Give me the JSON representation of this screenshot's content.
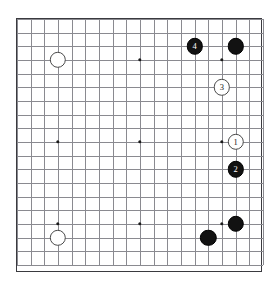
{
  "diagram": {
    "kind": "go-board-diagram",
    "board_size": 19,
    "geometry": {
      "origin_x": 16,
      "origin_y": 18,
      "spacing": 13.667,
      "lines": 19,
      "stone_radius": 7.2,
      "border_color": "#3a3a3f",
      "grid_color": "#8a8a90",
      "background": "#ffffff"
    },
    "star_points": [
      {
        "col": 3,
        "row": 3
      },
      {
        "col": 9,
        "row": 3
      },
      {
        "col": 15,
        "row": 3
      },
      {
        "col": 3,
        "row": 9
      },
      {
        "col": 9,
        "row": 9
      },
      {
        "col": 15,
        "row": 9
      },
      {
        "col": 3,
        "row": 15
      },
      {
        "col": 9,
        "row": 15
      },
      {
        "col": 15,
        "row": 15
      }
    ],
    "stones": [
      {
        "id": "stone-white-upper-left",
        "color": "white",
        "label": "",
        "col": 3,
        "row": 3
      },
      {
        "id": "stone-white-lower-left",
        "color": "white",
        "label": "",
        "col": 3,
        "row": 16
      },
      {
        "id": "stone-black-move-4",
        "color": "black",
        "label": "4",
        "col": 13,
        "row": 2
      },
      {
        "id": "stone-black-corner-top",
        "color": "black",
        "label": "",
        "col": 16,
        "row": 2
      },
      {
        "id": "stone-white-move-3",
        "color": "white",
        "label": "3",
        "col": 15,
        "row": 5
      },
      {
        "id": "stone-white-move-1",
        "color": "white",
        "label": "1",
        "col": 16,
        "row": 9
      },
      {
        "id": "stone-black-move-2",
        "color": "black",
        "label": "2",
        "col": 16,
        "row": 11
      },
      {
        "id": "stone-black-right-low",
        "color": "black",
        "label": "",
        "col": 16,
        "row": 15
      },
      {
        "id": "stone-black-bottom",
        "color": "black",
        "label": "",
        "col": 14,
        "row": 16
      }
    ],
    "move_labels": {
      "move_1": "1",
      "move_2": "2",
      "move_3": "3",
      "move_4": "4"
    }
  }
}
